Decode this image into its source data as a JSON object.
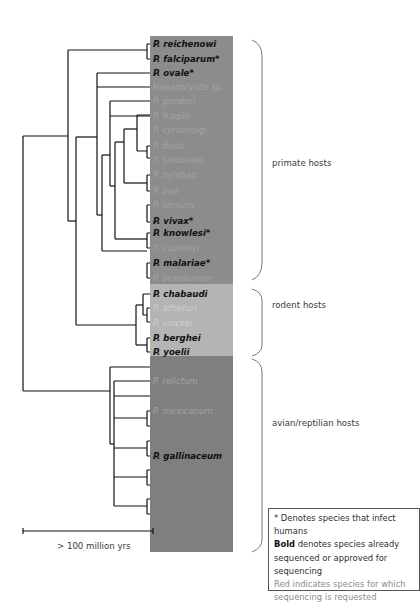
{
  "tree": {
    "leaves": [
      {
        "name": "P. reichenowi",
        "style": "bold"
      },
      {
        "name": "P. falciparum*",
        "style": "bold"
      },
      {
        "name": "P. ovale*",
        "style": "bold"
      },
      {
        "name": "Hepatocystis sp.",
        "style": "faint"
      },
      {
        "name": "P. gonderi",
        "style": "faint"
      },
      {
        "name": "P. fragile",
        "style": "faint"
      },
      {
        "name": "P. cynomolgi",
        "style": "faint"
      },
      {
        "name": "P. fieldi",
        "style": "faint"
      },
      {
        "name": "P. simiovale",
        "style": "faint"
      },
      {
        "name": "P. hylobati",
        "style": "faint"
      },
      {
        "name": "P. inui",
        "style": "faint"
      },
      {
        "name": "P. simium",
        "style": "faint"
      },
      {
        "name": "P. vivax*",
        "style": "bold"
      },
      {
        "name": "P. knowlesi*",
        "style": "bold"
      },
      {
        "name": "P. coatneyi",
        "style": "faint"
      },
      {
        "name": "P. malariae*",
        "style": "bold"
      },
      {
        "name": "P. brasilianum",
        "style": "faint"
      },
      {
        "name": "P. chabaudi",
        "style": "bold"
      },
      {
        "name": "P. atheruri",
        "style": "faint"
      },
      {
        "name": "P. vinckei",
        "style": "faint"
      },
      {
        "name": "P. berghei",
        "style": "bold"
      },
      {
        "name": "P. yoelii",
        "style": "bold"
      },
      {
        "name": "",
        "style": "faint"
      },
      {
        "name": "P. relictum",
        "style": "faint"
      },
      {
        "name": "",
        "style": "faint"
      },
      {
        "name": "P. mexicanum",
        "style": "faint"
      },
      {
        "name": "",
        "style": "faint"
      },
      {
        "name": "",
        "style": "faint"
      },
      {
        "name": "P. gallinaceum",
        "style": "bold"
      },
      {
        "name": "",
        "style": "faint"
      },
      {
        "name": "",
        "style": "faint"
      },
      {
        "name": "",
        "style": "faint"
      },
      {
        "name": "",
        "style": "faint"
      }
    ]
  },
  "host_groups": {
    "primate": "primate hosts",
    "rodent": "rodent hosts",
    "avian": "avian/reptilian hosts"
  },
  "scale_bar": {
    "label": "> 100 million yrs"
  },
  "legend": {
    "line1": "* Denotes species that infect humans",
    "bold_word": "Bold",
    "line2_rest": " denotes species already sequenced or approved for sequencing",
    "line3": "Red indicates species for which sequencing is requested"
  },
  "colors": {
    "primate_panel": "#8c8c8c",
    "rodent_panel": "#b4b4b4",
    "avian_panel": "#7f7f7f",
    "tree_line": "#111111",
    "brace": "#777777"
  }
}
